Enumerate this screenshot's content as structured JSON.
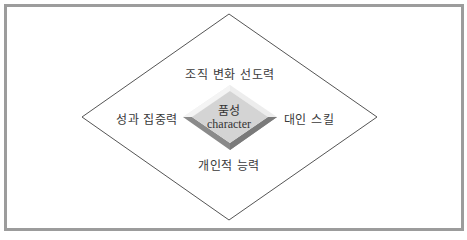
{
  "diagram": {
    "center": {
      "title_kr": "품성",
      "title_en": "character"
    },
    "top_label": "조직 변화 선도력",
    "left_label": "성과 집중력",
    "right_label": "대인 스킬",
    "bottom_label": "개인적 능력"
  },
  "colors": {
    "frame_border": "#9c9c9c",
    "outline": "#555555",
    "center_face": "#d4d4d4",
    "center_bevel_light": "#ededed",
    "center_bevel_dark": "#8a8a8a",
    "text": "#3a3a3a"
  }
}
